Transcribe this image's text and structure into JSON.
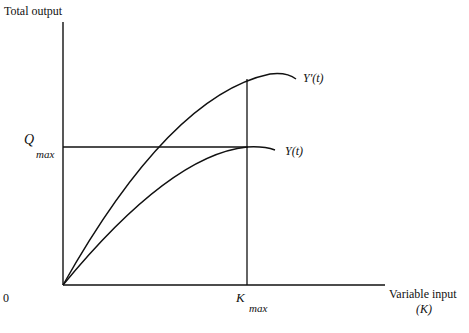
{
  "diagram": {
    "y_axis_label": "Total output",
    "x_axis_label": "Variable input",
    "x_axis_symbol": "(K)",
    "origin_label": "0",
    "q_max": {
      "symbol": "Q",
      "subscript": "max"
    },
    "k_max": {
      "symbol": "K",
      "subscript": "max"
    },
    "curves": [
      {
        "name": "upper-curve",
        "label": "Y'(t)"
      },
      {
        "name": "lower-curve",
        "label": "Y(t)"
      }
    ],
    "line_color": "#111111"
  }
}
